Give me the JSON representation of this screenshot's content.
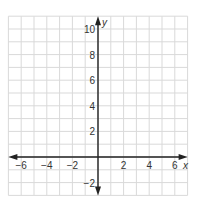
{
  "chart_data": {
    "type": "scatter",
    "title": "",
    "xlabel": "x",
    "ylabel": "y",
    "xlim": [
      -7,
      7
    ],
    "ylim": [
      -3,
      11
    ],
    "grid": true,
    "grid_step": 1,
    "x_ticks": [
      -6,
      -4,
      -2,
      2,
      4,
      6
    ],
    "y_ticks": [
      -2,
      2,
      4,
      6,
      8,
      10
    ],
    "x_tick_labels": [
      "−6",
      "−4",
      "−2",
      "2",
      "4",
      "6"
    ],
    "y_tick_labels": [
      "−2",
      "2",
      "4",
      "6",
      "8",
      "10"
    ],
    "series": [],
    "legend": null
  },
  "colors": {
    "grid": "#d9d9d9",
    "axis": "#222222",
    "text": "#333333"
  }
}
